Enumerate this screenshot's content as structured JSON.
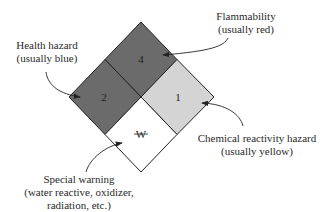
{
  "diagram": {
    "type": "NFPA 704 hazard diamond",
    "quadrants": {
      "top": {
        "value": "4",
        "fill": "#6b6b6b",
        "meaning": "Flammability"
      },
      "left": {
        "value": "2",
        "fill": "#6b6b6b",
        "meaning": "Health hazard"
      },
      "right": {
        "value": "1",
        "fill": "#d4d4d4",
        "meaning": "Chemical reactivity hazard"
      },
      "bottom": {
        "value": "W",
        "fill": "#ffffff",
        "meaning": "Special warning"
      }
    },
    "labels": {
      "flammability": {
        "line1": "Flammability",
        "line2": "(usually red)"
      },
      "health": {
        "line1": "Health hazard",
        "line2": "(usually blue)"
      },
      "reactivity": {
        "line1": "Chemical reactivity hazard",
        "line2": "(usually yellow)"
      },
      "special": {
        "line1": "Special warning",
        "line2": "(water reactive, oxidizer,",
        "line3": "radiation, etc.)"
      }
    }
  }
}
